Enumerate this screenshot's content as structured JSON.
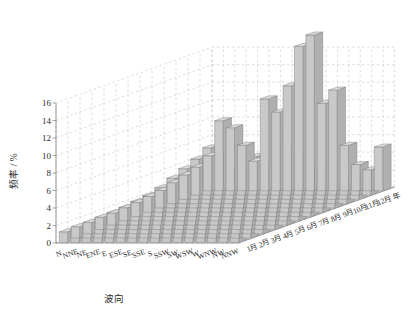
{
  "chart_data": {
    "type": "bar",
    "title": "",
    "subtitle": "",
    "xlabel": "波向",
    "ylabel": "频率 / %",
    "zlabel": "",
    "ylim": [
      0,
      16
    ],
    "yticks": [
      0,
      2,
      4,
      6,
      8,
      10,
      12,
      14,
      16
    ],
    "ytick_labels": [
      "0",
      "2",
      "4",
      "6",
      "8",
      "10",
      "12",
      "14",
      "16"
    ],
    "grid": true,
    "legend": null,
    "projection": "3d-bar",
    "categories": [
      "N",
      "NNE",
      "NE",
      "ENE",
      "E",
      "ESE",
      "SE",
      "SSE",
      "S",
      "SSW",
      "SW",
      "WSW",
      "W",
      "WNW",
      "NW",
      "NNW"
    ],
    "depth_categories": [
      "年",
      "12月",
      "11月",
      "10月",
      "9月",
      "8月",
      "7月",
      "6月",
      "5月",
      "4月",
      "3月",
      "2月",
      "1月"
    ],
    "series": [
      {
        "name": "年",
        "values": [
          4.0,
          8.0,
          7.2,
          5.2,
          3.4,
          10.5,
          9.0,
          12.0,
          16.5,
          17.8,
          10.0,
          11.5,
          5.2,
          3.0,
          2.4,
          5.0
        ]
      },
      {
        "name": "12月",
        "values": [
          3.2,
          5.4,
          4.8,
          3.0,
          2.0,
          4.4,
          3.6,
          4.0,
          5.0,
          4.6,
          3.4,
          3.8,
          2.2,
          1.6,
          1.4,
          2.6
        ]
      },
      {
        "name": "11月",
        "values": [
          2.8,
          4.6,
          4.2,
          2.6,
          1.8,
          3.8,
          3.2,
          3.6,
          4.4,
          4.0,
          3.0,
          3.2,
          2.0,
          1.4,
          1.2,
          2.2
        ]
      },
      {
        "name": "10月",
        "values": [
          2.4,
          4.0,
          3.6,
          2.4,
          1.6,
          3.4,
          3.0,
          3.4,
          4.0,
          3.8,
          2.8,
          3.0,
          1.8,
          1.2,
          1.0,
          2.0
        ]
      },
      {
        "name": "9月",
        "values": [
          2.0,
          3.4,
          3.0,
          2.0,
          1.4,
          3.0,
          2.8,
          3.2,
          3.8,
          3.6,
          2.6,
          2.8,
          1.6,
          1.2,
          1.0,
          1.8
        ]
      },
      {
        "name": "8月",
        "values": [
          1.8,
          2.8,
          2.6,
          1.8,
          1.2,
          2.8,
          2.6,
          3.0,
          3.6,
          3.4,
          2.4,
          2.6,
          1.6,
          1.0,
          0.9,
          1.6
        ]
      },
      {
        "name": "7月",
        "values": [
          1.6,
          2.4,
          2.2,
          1.6,
          1.1,
          2.6,
          2.4,
          2.8,
          3.4,
          3.2,
          2.2,
          2.4,
          1.4,
          1.0,
          0.8,
          1.5
        ]
      },
      {
        "name": "6月",
        "values": [
          1.5,
          2.2,
          2.0,
          1.5,
          1.0,
          2.4,
          2.2,
          2.6,
          3.2,
          3.0,
          2.0,
          2.2,
          1.4,
          0.9,
          0.8,
          1.4
        ]
      },
      {
        "name": "5月",
        "values": [
          1.4,
          2.0,
          1.9,
          1.4,
          1.0,
          2.2,
          2.0,
          2.4,
          3.0,
          2.8,
          1.9,
          2.0,
          1.3,
          0.9,
          0.7,
          1.4
        ]
      },
      {
        "name": "4月",
        "values": [
          1.4,
          1.9,
          1.8,
          1.3,
          0.9,
          2.0,
          1.9,
          2.2,
          2.8,
          2.6,
          1.8,
          1.9,
          1.2,
          0.8,
          0.7,
          1.6
        ]
      },
      {
        "name": "3月",
        "values": [
          1.3,
          1.8,
          1.7,
          1.2,
          0.9,
          1.9,
          1.8,
          2.0,
          2.6,
          2.4,
          1.7,
          1.8,
          1.2,
          0.8,
          0.7,
          2.0
        ]
      },
      {
        "name": "2月",
        "values": [
          1.3,
          1.7,
          1.6,
          1.2,
          0.8,
          1.8,
          1.7,
          1.9,
          2.4,
          2.2,
          1.6,
          1.7,
          1.1,
          0.8,
          0.7,
          3.2
        ]
      },
      {
        "name": "1月",
        "values": [
          1.2,
          1.6,
          1.5,
          1.1,
          0.8,
          1.7,
          1.6,
          1.8,
          2.2,
          2.0,
          1.5,
          1.6,
          1.1,
          0.7,
          0.6,
          8.6
        ]
      }
    ],
    "colors": {
      "bar_face": "#c9c9c9",
      "bar_top": "#dcdcdc",
      "bar_side": "#b0b0b0",
      "bar_edge": "#7a7a7a",
      "grid": "#c0c0c0",
      "axis": "#808080",
      "floor": "#ffffff",
      "text": "#2b2b2b"
    }
  }
}
